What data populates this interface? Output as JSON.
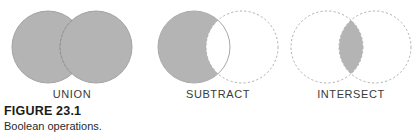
{
  "figure": {
    "caption_title": "FIGURE 23.1",
    "caption_text": "Boolean operations.",
    "width": 420,
    "height": 137
  },
  "style": {
    "fill_gray": "#b4b4b4",
    "stroke_gray": "#a8a8a8",
    "dash_gray": "#b0b0b0",
    "background": "#ffffff",
    "label_color": "#3a3a3a"
  },
  "diagram_data": {
    "type": "venn",
    "title": "Boolean operations.",
    "circle_radius": 36,
    "center_offset_x": 24,
    "center_y": 47,
    "operations": [
      {
        "id": "union",
        "label": "UNION",
        "description": "Both circles filled; overlap region boundary shown dashed.",
        "filled_regions": [
          "left-only",
          "overlap",
          "right-only"
        ],
        "left_circle_outline": "solid",
        "right_circle_outline": "dashed"
      },
      {
        "id": "subtract",
        "label": "SUBTRACT",
        "description": "Left circle filled minus overlap, forming a crescent; right circle outline dashed.",
        "filled_regions": [
          "left-only"
        ],
        "left_circle_outline": "solid",
        "right_circle_outline": "dashed"
      },
      {
        "id": "intersect",
        "label": "INTERSECT",
        "description": "Only the lens-shaped overlap is filled; both circle outlines dashed.",
        "filled_regions": [
          "overlap"
        ],
        "left_circle_outline": "dashed",
        "right_circle_outline": "dashed"
      }
    ]
  }
}
